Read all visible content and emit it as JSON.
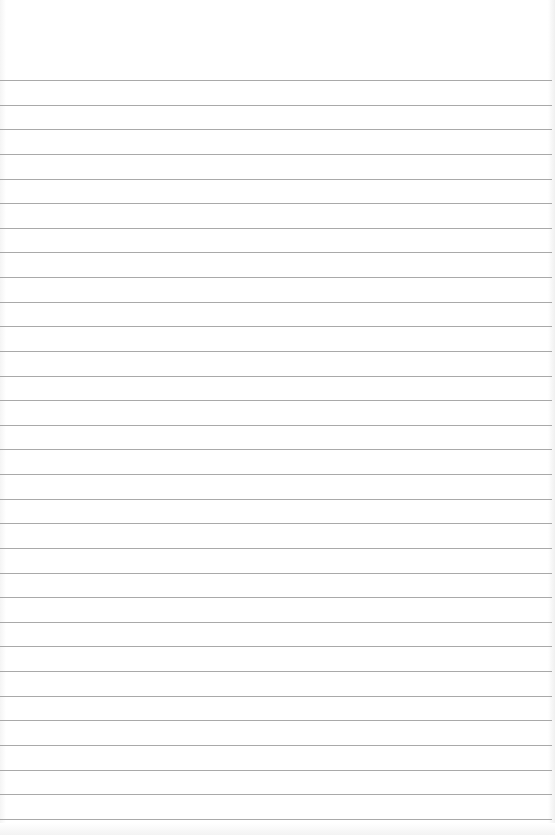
{
  "document": {
    "type": "lined-paper",
    "rule_color": "#9a9a9a",
    "background_color": "#ffffff",
    "first_rule_y": 80,
    "rule_spacing": 24.63,
    "rule_count": 31
  }
}
